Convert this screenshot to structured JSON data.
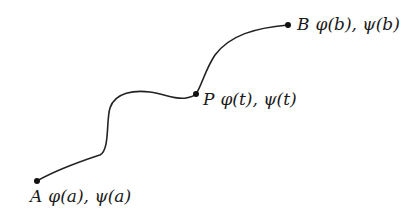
{
  "diagram": {
    "curve_color": "#222222",
    "points": [
      {
        "id": "A",
        "name": "A",
        "expr": "φ(a), ψ(a)"
      },
      {
        "id": "P",
        "name": "P",
        "expr": "φ(t), ψ(t)"
      },
      {
        "id": "B",
        "name": "B",
        "expr": "φ(b), ψ(b)"
      }
    ]
  }
}
